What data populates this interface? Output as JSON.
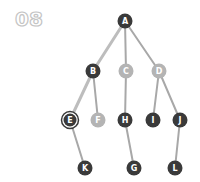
{
  "step": {
    "label": "08"
  },
  "colors": {
    "node_dark": "#3a3a3a",
    "node_light": "#b4b4b4",
    "edge_active": "#bdbdbd",
    "edge_default": "#a8a8a8",
    "label_outline": "#c4c4c4"
  },
  "tree": {
    "nodes": [
      {
        "id": "A",
        "label": "A",
        "x": 125,
        "y": 21,
        "style": "dark"
      },
      {
        "id": "B",
        "label": "B",
        "x": 93,
        "y": 71,
        "style": "dark"
      },
      {
        "id": "C",
        "label": "C",
        "x": 126,
        "y": 71,
        "style": "light"
      },
      {
        "id": "D",
        "label": "D",
        "x": 159,
        "y": 71,
        "style": "light"
      },
      {
        "id": "E",
        "label": "E",
        "x": 70,
        "y": 120,
        "style": "selected"
      },
      {
        "id": "F",
        "label": "F",
        "x": 98,
        "y": 120,
        "style": "light"
      },
      {
        "id": "H",
        "label": "H",
        "x": 125,
        "y": 120,
        "style": "dark"
      },
      {
        "id": "I",
        "label": "I",
        "x": 153,
        "y": 120,
        "style": "dark"
      },
      {
        "id": "J",
        "label": "J",
        "x": 180,
        "y": 120,
        "style": "dark"
      },
      {
        "id": "K",
        "label": "K",
        "x": 85,
        "y": 168,
        "style": "dark"
      },
      {
        "id": "G",
        "label": "G",
        "x": 134,
        "y": 168,
        "style": "dark"
      },
      {
        "id": "L",
        "label": "L",
        "x": 175,
        "y": 168,
        "style": "dark"
      }
    ],
    "edges": [
      {
        "from": "A",
        "to": "B",
        "active": true
      },
      {
        "from": "A",
        "to": "C",
        "active": false
      },
      {
        "from": "A",
        "to": "D",
        "active": false
      },
      {
        "from": "B",
        "to": "E",
        "active": true
      },
      {
        "from": "B",
        "to": "F",
        "active": false
      },
      {
        "from": "C",
        "to": "H",
        "active": false
      },
      {
        "from": "D",
        "to": "I",
        "active": false
      },
      {
        "from": "D",
        "to": "J",
        "active": false
      },
      {
        "from": "E",
        "to": "K",
        "active": false
      },
      {
        "from": "H",
        "to": "G",
        "active": false
      },
      {
        "from": "J",
        "to": "L",
        "active": false
      }
    ]
  }
}
